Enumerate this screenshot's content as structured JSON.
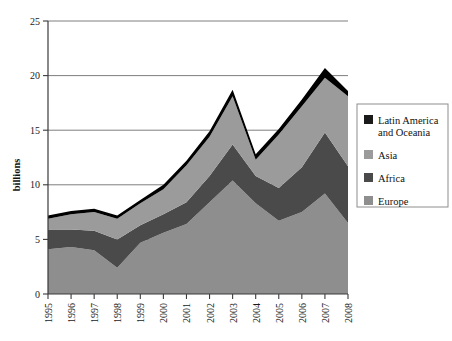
{
  "chart_data": {
    "type": "area",
    "stacked": true,
    "title": "",
    "xlabel": "",
    "ylabel": "billions",
    "ylim": [
      0,
      25
    ],
    "yticks": [
      0,
      5,
      10,
      15,
      20,
      25
    ],
    "grid": true,
    "legend_position": "right",
    "categories": [
      "1995",
      "1996",
      "1997",
      "1998",
      "1999",
      "2000",
      "2001",
      "2002",
      "2003",
      "2004",
      "2005",
      "2006",
      "2007",
      "2008"
    ],
    "series": [
      {
        "name": "Europe",
        "color": "#8e8e8e",
        "values": [
          4.1,
          4.3,
          4.0,
          2.4,
          4.7,
          5.6,
          6.4,
          8.4,
          10.4,
          8.3,
          6.7,
          7.5,
          9.2,
          6.5
        ]
      },
      {
        "name": "Africa",
        "color": "#4a4a4a",
        "values": [
          1.8,
          1.6,
          1.8,
          2.6,
          1.6,
          1.7,
          2.0,
          2.4,
          3.3,
          2.5,
          3.0,
          4.1,
          5.6,
          5.2
        ]
      },
      {
        "name": "Asia",
        "color": "#9b9b9b",
        "values": [
          1.0,
          1.4,
          1.7,
          1.9,
          2.0,
          2.3,
          3.4,
          3.6,
          4.4,
          1.5,
          4.9,
          5.6,
          5.0,
          6.4
        ]
      },
      {
        "name": "Latin America and Oceania",
        "color": "#000000",
        "values": [
          0.3,
          0.3,
          0.3,
          0.3,
          0.3,
          0.4,
          0.4,
          0.5,
          0.6,
          0.5,
          0.5,
          0.6,
          0.9,
          0.5
        ]
      }
    ],
    "totals": [
      7.2,
      7.6,
      7.8,
      7.2,
      8.6,
      10.0,
      12.2,
      14.9,
      18.7,
      12.8,
      15.1,
      17.8,
      20.7,
      18.6
    ]
  },
  "legend": {
    "entries": [
      {
        "label": "Latin America and Oceania",
        "color": "#1a1a1a"
      },
      {
        "label": "Asia",
        "color": "#9b9b9b"
      },
      {
        "label": "Africa",
        "color": "#4a4a4a"
      },
      {
        "label": "Europe",
        "color": "#8e8e8e"
      }
    ]
  },
  "axes": {
    "y_title": "billions",
    "y_ticks": [
      "0",
      "5",
      "10",
      "15",
      "20",
      "25"
    ],
    "x_ticks": [
      "1995",
      "1996",
      "1997",
      "1998",
      "1999",
      "2000",
      "2001",
      "2002",
      "2003",
      "2004",
      "2005",
      "2006",
      "2007",
      "2008"
    ]
  }
}
